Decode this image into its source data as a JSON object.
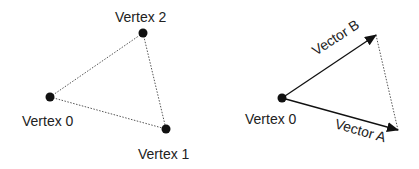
{
  "left_diagram": {
    "labels": {
      "v0": "Vertex 0",
      "v1": "Vertex 1",
      "v2": "Vertex 2"
    }
  },
  "right_diagram": {
    "labels": {
      "v0": "Vertex 0",
      "vector_a": "Vector A",
      "vector_b": "Vector B"
    }
  },
  "colors": {
    "stroke": "#222222",
    "dotted": "#555555"
  }
}
